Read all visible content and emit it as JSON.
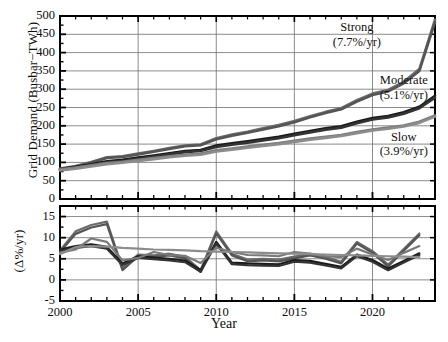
{
  "chart_data": {
    "type": "line",
    "title": "",
    "xlabel": "Year",
    "panels": [
      {
        "name": "grid-demand",
        "ylabel": "Grid Demand (Busbar−TWh)",
        "ylim": [
          0,
          500
        ],
        "yticks": [
          0,
          50,
          100,
          150,
          200,
          250,
          300,
          350,
          400,
          450,
          500
        ],
        "xlim": [
          2000,
          2024
        ],
        "xticks": [
          2000,
          2005,
          2010,
          2015,
          2020
        ],
        "grid": true,
        "annotations": [
          {
            "id": "strong",
            "line1": "Strong",
            "line2": "(7.7%/yr)",
            "x": 2019.0,
            "y": 450
          },
          {
            "id": "moderate",
            "line1": "Moderate",
            "line2": "(5.1%/yr)",
            "x": 2022.0,
            "y": 305
          },
          {
            "id": "slow",
            "line1": "Slow",
            "line2": "(3.9%/yr)",
            "x": 2022.0,
            "y": 150
          }
        ],
        "series": [
          {
            "name": "Strong",
            "rate_label": "7.7%/yr",
            "color": "#6b6b6b",
            "x": [
              2000,
              2001,
              2002,
              2003,
              2004,
              2005,
              2006,
              2007,
              2008,
              2009,
              2010,
              2011,
              2012,
              2013,
              2014,
              2015,
              2016,
              2017,
              2018,
              2019,
              2020,
              2021,
              2022,
              2023,
              2024
            ],
            "values": [
              83,
              90,
              101,
              114,
              117,
              124,
              131,
              139,
              146,
              149,
              166,
              176,
              184,
              193,
              202,
              213,
              226,
              238,
              248,
              270,
              288,
              298,
              320,
              355,
              490
            ]
          },
          {
            "name": "Strong-variant",
            "rate_label": "7.7%/yr",
            "color": "#555555",
            "x": [
              2000,
              2001,
              2002,
              2003,
              2004,
              2005,
              2006,
              2007,
              2008,
              2009,
              2010,
              2011,
              2012,
              2013,
              2014,
              2015,
              2016,
              2017,
              2018,
              2019,
              2020,
              2021,
              2022,
              2023,
              2024
            ],
            "values": [
              80,
              88,
              99,
              112,
              115,
              122,
              129,
              137,
              144,
              147,
              163,
              173,
              181,
              190,
              199,
              210,
              223,
              235,
              245,
              266,
              284,
              294,
              316,
              350,
              483
            ]
          },
          {
            "name": "Moderate",
            "rate_label": "5.1%/yr",
            "color": "#1a1a1a",
            "x": [
              2000,
              2001,
              2002,
              2003,
              2004,
              2005,
              2006,
              2007,
              2008,
              2009,
              2010,
              2011,
              2012,
              2013,
              2014,
              2015,
              2016,
              2017,
              2018,
              2019,
              2020,
              2021,
              2022,
              2023,
              2024
            ],
            "values": [
              82,
              88,
              95,
              103,
              107,
              113,
              119,
              125,
              131,
              134,
              146,
              152,
              158,
              164,
              170,
              178,
              186,
              193,
              199,
              211,
              221,
              227,
              237,
              252,
              282
            ]
          },
          {
            "name": "Moderate-variant",
            "rate_label": "5.1%/yr",
            "color": "#333333",
            "x": [
              2000,
              2001,
              2002,
              2003,
              2004,
              2005,
              2006,
              2007,
              2008,
              2009,
              2010,
              2011,
              2012,
              2013,
              2014,
              2015,
              2016,
              2017,
              2018,
              2019,
              2020,
              2021,
              2022,
              2023,
              2024
            ],
            "values": [
              79,
              85,
              92,
              100,
              104,
              110,
              116,
              122,
              128,
              131,
              142,
              148,
              154,
              160,
              166,
              174,
              182,
              189,
              195,
              207,
              217,
              223,
              233,
              248,
              277
            ]
          },
          {
            "name": "Slow",
            "rate_label": "3.9%/yr",
            "color": "#7a7a7a",
            "x": [
              2000,
              2001,
              2002,
              2003,
              2004,
              2005,
              2006,
              2007,
              2008,
              2009,
              2010,
              2011,
              2012,
              2013,
              2014,
              2015,
              2016,
              2017,
              2018,
              2019,
              2020,
              2021,
              2022,
              2023,
              2024
            ],
            "values": [
              81,
              86,
              92,
              98,
              102,
              107,
              112,
              117,
              121,
              124,
              133,
              138,
              143,
              148,
              153,
              159,
              165,
              170,
              175,
              183,
              190,
              195,
              201,
              211,
              228
            ]
          },
          {
            "name": "Slow-variant",
            "rate_label": "3.9%/yr",
            "color": "#8c8c8c",
            "x": [
              2000,
              2001,
              2002,
              2003,
              2004,
              2005,
              2006,
              2007,
              2008,
              2009,
              2010,
              2011,
              2012,
              2013,
              2014,
              2015,
              2016,
              2017,
              2018,
              2019,
              2020,
              2021,
              2022,
              2023,
              2024
            ],
            "values": [
              78,
              83,
              89,
              95,
              99,
              104,
              109,
              114,
              118,
              121,
              130,
              135,
              140,
              145,
              150,
              156,
              162,
              167,
              172,
              180,
              187,
              192,
              198,
              208,
              225
            ]
          }
        ]
      },
      {
        "name": "growth-rate",
        "ylabel": "(Δ%/yr)",
        "ylim": [
          -5,
          17.5
        ],
        "yticks": [
          -5,
          0,
          5,
          10,
          15
        ],
        "xlim": [
          2000,
          2024
        ],
        "xticks": [
          2000,
          2005,
          2010,
          2015,
          2020
        ],
        "grid": true,
        "series": [
          {
            "name": "Strong",
            "color": "#6b6b6b",
            "x": [
              2000,
              2001,
              2002,
              2003,
              2004,
              2005,
              2006,
              2007,
              2008,
              2009,
              2010,
              2011,
              2012,
              2013,
              2014,
              2015,
              2016,
              2017,
              2018,
              2019,
              2020,
              2021,
              2022,
              2023
            ],
            "values": [
              7.0,
              11.5,
              13.0,
              13.8,
              2.8,
              6.0,
              5.8,
              6.2,
              5.5,
              2.3,
              11.5,
              6.2,
              4.8,
              5.0,
              4.8,
              5.5,
              6.2,
              5.4,
              4.3,
              9.0,
              6.8,
              3.6,
              7.3,
              11.0
            ]
          },
          {
            "name": "Strong-variant",
            "color": "#555555",
            "x": [
              2000,
              2001,
              2002,
              2003,
              2004,
              2005,
              2006,
              2007,
              2008,
              2009,
              2010,
              2011,
              2012,
              2013,
              2014,
              2015,
              2016,
              2017,
              2018,
              2019,
              2020,
              2021,
              2022,
              2023
            ],
            "values": [
              6.6,
              10.9,
              12.4,
              13.2,
              2.3,
              5.6,
              5.4,
              5.8,
              5.1,
              1.9,
              11.0,
              5.8,
              4.4,
              4.6,
              4.4,
              5.1,
              5.8,
              5.0,
              3.9,
              8.6,
              6.4,
              3.2,
              6.9,
              10.6
            ]
          },
          {
            "name": "Moderate",
            "color": "#1a1a1a",
            "x": [
              2000,
              2001,
              2002,
              2003,
              2004,
              2005,
              2006,
              2007,
              2008,
              2009,
              2010,
              2011,
              2012,
              2013,
              2014,
              2015,
              2016,
              2017,
              2018,
              2019,
              2020,
              2021,
              2022,
              2023
            ],
            "values": [
              7.2,
              8.0,
              8.4,
              7.8,
              3.9,
              5.6,
              5.3,
              5.0,
              4.6,
              2.3,
              9.0,
              4.1,
              3.9,
              3.8,
              3.7,
              4.7,
              4.5,
              3.8,
              3.1,
              6.0,
              4.7,
              2.7,
              4.5,
              6.3
            ]
          },
          {
            "name": "Moderate-variant",
            "color": "#333333",
            "x": [
              2000,
              2001,
              2002,
              2003,
              2004,
              2005,
              2006,
              2007,
              2008,
              2009,
              2010,
              2011,
              2012,
              2013,
              2014,
              2015,
              2016,
              2017,
              2018,
              2019,
              2020,
              2021,
              2022,
              2023
            ],
            "values": [
              6.9,
              7.6,
              8.0,
              7.4,
              3.5,
              5.2,
              4.9,
              4.6,
              4.2,
              1.9,
              8.6,
              3.7,
              3.5,
              3.4,
              3.3,
              4.3,
              4.1,
              3.4,
              2.7,
              5.6,
              4.3,
              2.3,
              4.1,
              5.9
            ]
          },
          {
            "name": "Slow",
            "color": "#7a7a7a",
            "x": [
              2000,
              2001,
              2002,
              2003,
              2004,
              2005,
              2006,
              2007,
              2008,
              2009,
              2010,
              2011,
              2012,
              2013,
              2014,
              2015,
              2016,
              2017,
              2018,
              2019,
              2020,
              2021,
              2022,
              2023
            ],
            "values": [
              6.4,
              7.2,
              9.8,
              9.0,
              4.6,
              5.2,
              6.6,
              5.9,
              5.7,
              4.0,
              7.6,
              6.6,
              5.9,
              5.8,
              5.6,
              6.6,
              6.2,
              5.6,
              5.4,
              7.4,
              6.0,
              4.7,
              6.4,
              8.0
            ]
          },
          {
            "name": "Slow-variant",
            "color": "#8c8c8c",
            "x": [
              2000,
              2001,
              2002,
              2003,
              2004,
              2005,
              2006,
              2007,
              2008,
              2009,
              2010,
              2011,
              2012,
              2013,
              2014,
              2015,
              2016,
              2017,
              2018,
              2019,
              2020,
              2021,
              2022,
              2023
            ],
            "values": [
              6.1,
              7.8,
              8.0,
              7.9,
              7.6,
              7.4,
              7.2,
              7.1,
              7.0,
              6.8,
              6.7,
              6.6,
              6.5,
              6.4,
              6.3,
              6.2,
              6.1,
              6.0,
              5.9,
              5.8,
              5.7,
              5.6,
              5.5,
              5.4
            ]
          }
        ]
      }
    ]
  }
}
